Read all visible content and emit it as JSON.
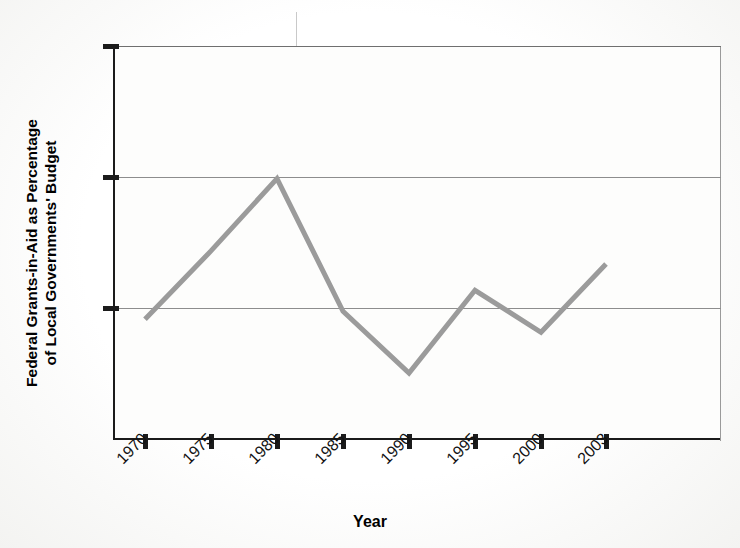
{
  "chart_data": {
    "type": "line",
    "title": "",
    "xlabel": "Year",
    "ylabel": "Federal Grants-in-Aid as Percentage of Local Governments' Budget",
    "ylabel_line1": "Federal Grants-in-Aid as Percentage",
    "ylabel_line2": "of Local Governments' Budget",
    "categories": [
      "1970",
      "1975",
      "1980",
      "1985",
      "1990",
      "1995",
      "2000",
      "2003"
    ],
    "x": [
      1970,
      1975,
      1980,
      1985,
      1990,
      1995,
      2000,
      2003
    ],
    "values": [
      29.2,
      34.4,
      39.9,
      29.8,
      25.1,
      31.4,
      28.2,
      33.4
    ],
    "ylim": [
      20,
      50
    ],
    "yticks": [
      20,
      30,
      40,
      50
    ],
    "ytick_labels": [
      "20",
      "30",
      "40",
      "50"
    ],
    "xtick_labels": [
      "1970",
      "1975",
      "1980",
      "1985",
      "1990",
      "1995",
      "2000",
      "2003"
    ],
    "grid": true,
    "grid_axis": "y",
    "legend": "none",
    "series": [
      {
        "name": "Federal grants-in-aid share",
        "color": "#9b9b9b",
        "values": [
          29.2,
          34.4,
          39.9,
          29.8,
          25.1,
          31.4,
          28.2,
          33.4
        ]
      }
    ],
    "colors": {
      "line": "#9b9b9b",
      "axis": "#1b1b1b",
      "grid": "#8d8d8d",
      "background": "#ffffff",
      "text": "#111111"
    }
  }
}
